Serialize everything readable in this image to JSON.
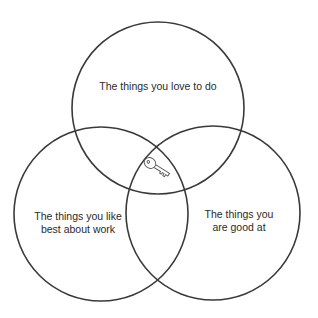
{
  "diagram": {
    "type": "venn",
    "sets": [
      {
        "id": "love",
        "label": "The things you love to do",
        "lines": [
          "The things you love to do"
        ]
      },
      {
        "id": "like",
        "label": "The things you like best about work",
        "lines": [
          "The things you like",
          "best about work"
        ]
      },
      {
        "id": "good",
        "label": "The things you are good at",
        "lines": [
          "The things you",
          "are good at"
        ]
      }
    ],
    "center_icon": "key-icon",
    "stroke_color": "#3a3a3a"
  }
}
